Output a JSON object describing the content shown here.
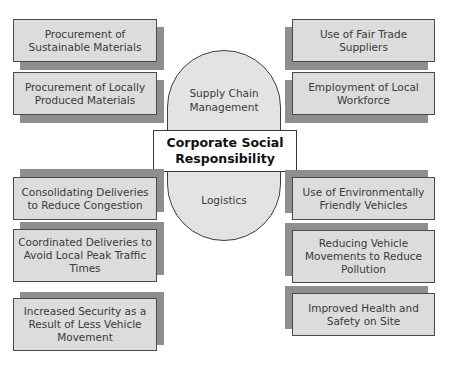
{
  "diagram": {
    "center": {
      "label": "Corporate Social Responsibility",
      "line1": "Corporate Social",
      "line2": "Responsibility"
    },
    "branches": [
      {
        "label": "Supply Chain Management",
        "line1": "Supply Chain",
        "line2": "Management"
      },
      {
        "label": "Logistics"
      }
    ],
    "left_top": [
      {
        "line1": "Procurement of",
        "line2": "Sustainable Materials"
      },
      {
        "line1": "Procurement of Locally",
        "line2": "Produced Materials"
      }
    ],
    "right_top": [
      {
        "line1": "Use of Fair Trade",
        "line2": "Suppliers"
      },
      {
        "line1": "Employment of Local",
        "line2": "Workforce"
      }
    ],
    "left_bottom": [
      {
        "line1": "Consolidating Deliveries",
        "line2": "to Reduce Congestion"
      },
      {
        "line1": "Coordinated Deliveries to",
        "line2": "Avoid Local Peak Traffic",
        "line3": "Times"
      },
      {
        "line1": "Increased Security as a",
        "line2": "Result of Less Vehicle",
        "line3": "Movement"
      }
    ],
    "right_bottom": [
      {
        "line1": "Use of Environmentally",
        "line2": "Friendly Vehicles"
      },
      {
        "line1": "Reducing Vehicle",
        "line2": "Movements to Reduce",
        "line3": "Pollution"
      },
      {
        "line1": "Improved Health and",
        "line2": "Safety on Site"
      }
    ]
  },
  "colors": {
    "box_fill": "#dcdcdc",
    "shadow": "#8f8f8f",
    "pill_fill": "#e3e3e3",
    "border": "#4a4a4a"
  }
}
